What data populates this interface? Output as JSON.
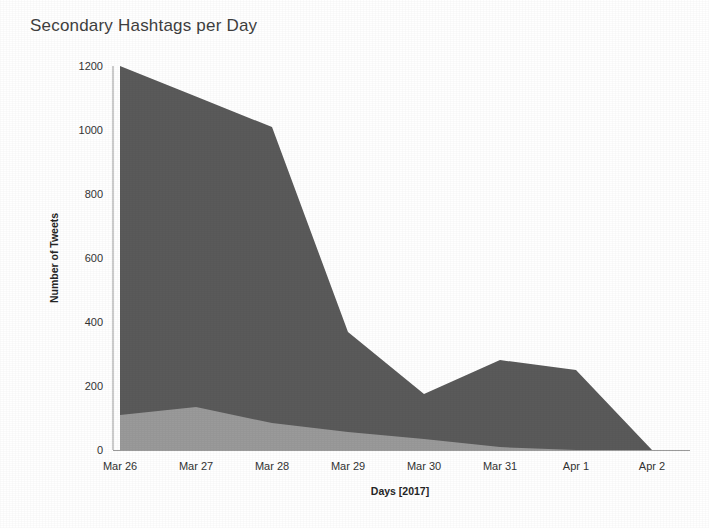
{
  "chart_data": {
    "type": "area",
    "title": "Secondary Hashtags per Day",
    "xlabel": "Days [2017]",
    "ylabel": "Number of Tweets",
    "categories": [
      "Mar 26",
      "Mar 27",
      "Mar 28",
      "Mar 29",
      "Mar 30",
      "Mar 31",
      "Apr 1",
      "Apr 2"
    ],
    "series": [
      {
        "name": "upper-band",
        "values": [
          1200,
          1105,
          1009,
          369,
          175,
          281,
          250,
          0
        ]
      },
      {
        "name": "lower-band",
        "values": [
          109,
          134,
          84,
          56,
          34,
          9,
          0,
          0
        ]
      }
    ],
    "stacked": false,
    "overlay": true,
    "ylim": [
      0,
      1200
    ],
    "yticks": [
      0,
      200,
      400,
      600,
      800,
      1000,
      1200
    ],
    "ytick_labels": [
      "0",
      "200",
      "400",
      "600",
      "800",
      "1000",
      "1200"
    ],
    "grid": false,
    "legend": null,
    "colors": {
      "upper_area": "#5a5a5a",
      "lower_area": "#9a9a9a",
      "axis": "#9b9b9b",
      "text": "#333333",
      "title": "#3f3f3f",
      "background": "#ffffff"
    }
  }
}
